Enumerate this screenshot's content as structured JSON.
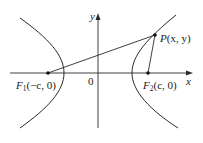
{
  "figure": {
    "type": "hyperbola-foci-diagram",
    "colors": {
      "background": "#ffffff",
      "stroke": "#2a2a2a",
      "text": "#222222"
    },
    "axes": {
      "x_label": "x",
      "y_label": "y",
      "origin_label": "0"
    },
    "points": {
      "F1": {
        "name": "F",
        "subscript": "1",
        "coords": "(−c, 0)"
      },
      "F2": {
        "name": "F",
        "subscript": "2",
        "coords": "(c, 0)"
      },
      "P": {
        "name": "P",
        "coords": "(x, y)"
      }
    },
    "segments": [
      "F1-P",
      "F2-P"
    ],
    "curves": [
      "left-branch",
      "right-branch"
    ]
  }
}
